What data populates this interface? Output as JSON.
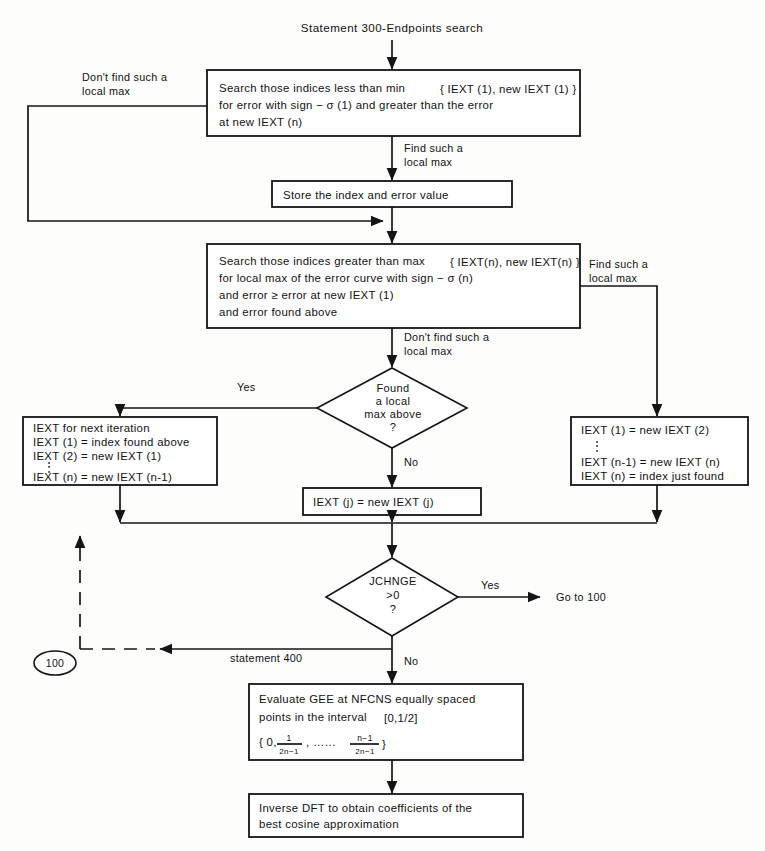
{
  "diagram": {
    "title": "Statement 300-Endpoints search",
    "nodes": {
      "search_low": {
        "line1": "Search those indices less than min",
        "line1_brace": "{ IEXT (1), new IEXT (1) }",
        "line2": "for error with sign − σ (1) and greater than the error",
        "line3": "at new IEXT (n)"
      },
      "store": {
        "text": "Store the index and error value"
      },
      "search_high": {
        "line1": "Search those indices greater than max",
        "line1_brace": "{ IEXT(n), new IEXT(n) }",
        "line2": "for local max of the error curve with sign − σ (n)",
        "line3": "and error ≥ error at new IEXT (1)",
        "line4": "and error found above"
      },
      "found_local_max": {
        "line1": "Found",
        "line2": "a local",
        "line3": "max above",
        "line4": "?"
      },
      "iext_next_iteration": {
        "line1": "IEXT for next iteration",
        "line2": "IEXT (1) = index found above",
        "line3": "IEXT (2) = new IEXT (1)",
        "line4": "⋮",
        "line5": "IEXT (n) = new IEXT (n-1)"
      },
      "iext_j": {
        "text": "IEXT (j) = new IEXT (j)"
      },
      "iext_shift": {
        "line1": "IEXT (1) = new IEXT (2)",
        "line2": "⋮",
        "line3": "IEXT (n-1) = new IEXT (n)",
        "line4": "IEXT (n) = index just found"
      },
      "jchnge": {
        "line1": "JCHNGE",
        "line2": ">0",
        "line3": "?"
      },
      "goto_100": {
        "text": "Go to 100"
      },
      "connector_100": {
        "text": "100"
      },
      "evaluate_gee": {
        "line1": "Evaluate GEE at NFCNS equally spaced",
        "line2": "points in the interval",
        "line2_bracket": "[0,1/2]",
        "line3_open": "{ 0,",
        "line3_frac1_num": "1",
        "line3_frac1_den": "2n−1",
        "line3_mid": ", ……",
        "line3_frac2_num": "n−1",
        "line3_frac2_den": "2n−1",
        "line3_close": "}"
      },
      "inverse_dft": {
        "line1": "Inverse DFT to obtain coefficients of the",
        "line2": "best cosine approximation"
      }
    },
    "edge_labels": {
      "dont_find_left_1": "Don't find such a",
      "dont_find_left_2": "local max",
      "find_such_1": "Find such a",
      "find_such_2": "local max",
      "find_such_right_1": "Find such a",
      "find_such_right_2": "local max",
      "dont_find_mid_1": "Don't find such a",
      "dont_find_mid_2": "local max",
      "yes_diamond1": "Yes",
      "no_diamond1": "No",
      "yes_diamond2": "Yes",
      "no_diamond2": "No",
      "statement_400": "statement 400"
    },
    "colors": {
      "stroke": "#141414",
      "background": "#fdfdfc",
      "text": "#111111"
    }
  }
}
